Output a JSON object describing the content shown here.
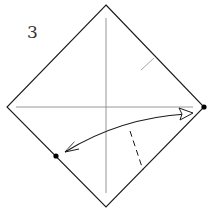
{
  "diagram": {
    "step_number": "3",
    "type": "origami folding step",
    "colors": {
      "outline": "#1a1a1a",
      "crease": "#888888",
      "arrow": "#1a1a1a",
      "background": "#ffffff"
    },
    "square": {
      "shape": "diamond",
      "vertices": {
        "top": [
          106,
          5
        ],
        "right": [
          204,
          107
        ],
        "bottom": [
          106,
          207
        ],
        "left": [
          7,
          107
        ]
      }
    },
    "creases": [
      {
        "name": "vertical-diagonal",
        "from": [
          106,
          18
        ],
        "to": [
          106,
          193
        ]
      },
      {
        "name": "horizontal-diagonal",
        "from": [
          16,
          107
        ],
        "to": [
          193,
          107
        ]
      },
      {
        "name": "pinch-mark",
        "from": [
          141,
          70
        ],
        "to": [
          154,
          58
        ]
      }
    ],
    "fold_line": {
      "style": "dashed",
      "from": [
        130,
        131
      ],
      "to": [
        143,
        170
      ]
    },
    "reference_points": [
      {
        "name": "right-corner-dot",
        "at": [
          204,
          107
        ]
      },
      {
        "name": "lower-left-edge-dot",
        "at": [
          56,
          156
        ]
      }
    ],
    "arrow": {
      "kind": "fold-and-unfold",
      "from": [
        65,
        152
      ],
      "to": [
        192,
        113
      ],
      "description": "Bring the right corner to the marked point on the lower-left edge, then unfold"
    }
  }
}
